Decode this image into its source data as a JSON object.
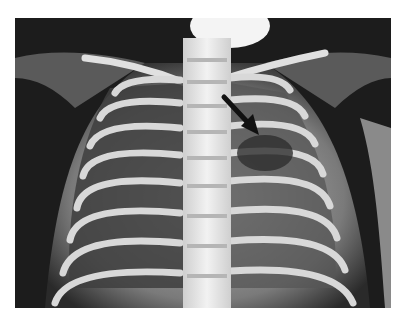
{
  "image": {
    "subject": "infant chest radiograph (frontal view)",
    "annotation": "black arrow pointing to left upper lung region",
    "colors": {
      "background": "#ffffff",
      "film_dark": "#1a1a1a",
      "bone": "#e8e8e8",
      "lung": "#4a4a4a",
      "arrow": "#111111"
    }
  }
}
